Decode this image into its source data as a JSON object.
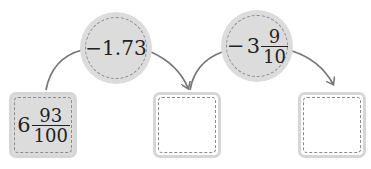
{
  "diagram": {
    "type": "operation-chain",
    "start": {
      "whole": "6",
      "numerator": "93",
      "denominator": "100"
    },
    "operations": [
      {
        "label": "−1.73",
        "value": "-1.73"
      },
      {
        "sign": "−",
        "whole": "3",
        "numerator": "9",
        "denominator": "10"
      }
    ],
    "result_boxes": [
      {
        "value": ""
      },
      {
        "value": ""
      }
    ]
  },
  "colors": {
    "fill": "#dcdcdc",
    "dashed_border": "#8a8a8a",
    "arrow": "#777777"
  }
}
